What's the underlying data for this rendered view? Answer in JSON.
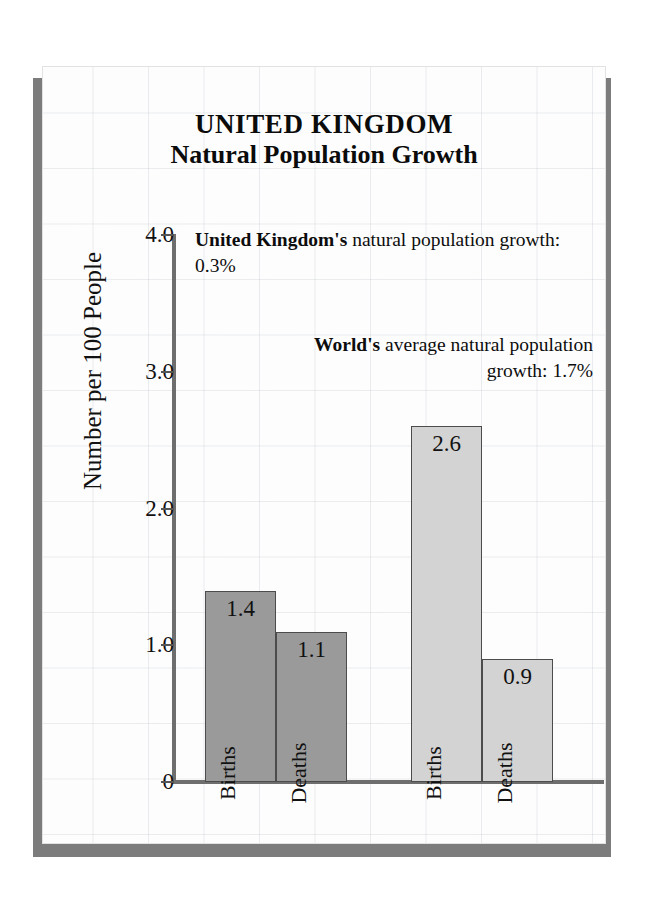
{
  "title": {
    "line1": "UNITED KINGDOM",
    "line2": "Natural Population Growth"
  },
  "annotations": {
    "country": {
      "lead": "United Kingdom's",
      "rest": " natural population growth:  0.3%",
      "full": "United Kingdom's natural population growth:  0.3%"
    },
    "world": {
      "lead": "World's",
      "rest": " average natural population growth:  1.7%",
      "full": "World's average natural population growth:  1.7%"
    }
  },
  "chart_data": {
    "type": "bar",
    "title": "UNITED KINGDOM Natural Population Growth",
    "xlabel": "",
    "ylabel": "Number per 100 People",
    "ylim": [
      0,
      4.0
    ],
    "yticks": [
      "0",
      "1.0",
      "2.0",
      "3.0",
      "4.0"
    ],
    "ytick_values": [
      0,
      1.0,
      2.0,
      3.0,
      4.0
    ],
    "grid": true,
    "legend": "none",
    "groups": [
      {
        "name": "United Kingdom",
        "color": "#9a9a9a",
        "bars": [
          {
            "category": "Births",
            "value": 1.4,
            "label": "1.4"
          },
          {
            "category": "Deaths",
            "value": 1.1,
            "label": "1.1"
          }
        ]
      },
      {
        "name": "World",
        "color": "#d3d3d3",
        "bars": [
          {
            "category": "Births",
            "value": 2.6,
            "label": "2.6"
          },
          {
            "category": "Deaths",
            "value": 0.9,
            "label": "0.9"
          }
        ]
      }
    ],
    "notes": [
      "United Kingdom's natural population growth:  0.3%",
      "World's average natural population growth:  1.7%"
    ]
  },
  "colors": {
    "uk_bar": "#9a9a9a",
    "world_bar": "#d3d3d3",
    "axis": "#6e6e6e",
    "bar_outline": "#4c4c4c",
    "card_shadow": "#7c7c7c"
  }
}
